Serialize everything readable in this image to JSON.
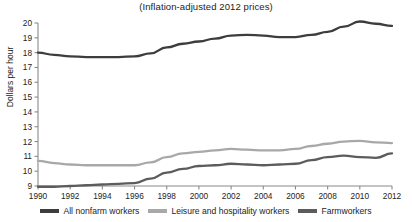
{
  "chart_data": {
    "type": "line",
    "title": "(Inflation-adjusted 2012 prices)",
    "xlabel": "",
    "ylabel": "Dollars per hour",
    "xlim": [
      1990,
      2012
    ],
    "ylim": [
      9,
      20
    ],
    "grid": false,
    "legend_position": "bottom",
    "x": [
      1990,
      1991,
      1992,
      1993,
      1994,
      1995,
      1996,
      1997,
      1998,
      1999,
      2000,
      2001,
      2002,
      2003,
      2004,
      2005,
      2006,
      2007,
      2008,
      2009,
      2010,
      2011,
      2012
    ],
    "xticks": [
      "1990",
      "1992",
      "1994",
      "1996",
      "1998",
      "2000",
      "2002",
      "2004",
      "2006",
      "2008",
      "2010",
      "2012"
    ],
    "yticks": [
      "9",
      "10",
      "11",
      "12",
      "13",
      "14",
      "15",
      "16",
      "17",
      "18",
      "19",
      "20"
    ],
    "series": [
      {
        "name": "All nonfarm workers",
        "color": "#3d3d3d",
        "values": [
          18.0,
          17.85,
          17.75,
          17.7,
          17.7,
          17.7,
          17.75,
          17.95,
          18.35,
          18.6,
          18.75,
          18.95,
          19.15,
          19.2,
          19.15,
          19.05,
          19.05,
          19.2,
          19.4,
          19.75,
          20.1,
          19.95,
          19.8
        ]
      },
      {
        "name": "Leisure and hospitality workers",
        "color": "#a8a8a8",
        "values": [
          10.7,
          10.55,
          10.45,
          10.4,
          10.4,
          10.4,
          10.4,
          10.6,
          10.95,
          11.2,
          11.3,
          11.4,
          11.5,
          11.45,
          11.4,
          11.4,
          11.5,
          11.7,
          11.85,
          12.0,
          12.05,
          11.95,
          11.9
        ]
      },
      {
        "name": "Farmworkers",
        "color": "#5c5c5c",
        "values": [
          8.95,
          8.95,
          9.0,
          9.05,
          9.1,
          9.15,
          9.2,
          9.5,
          9.9,
          10.15,
          10.35,
          10.4,
          10.5,
          10.45,
          10.4,
          10.45,
          10.5,
          10.75,
          10.95,
          11.05,
          10.95,
          10.9,
          11.2
        ]
      }
    ]
  },
  "legend": {
    "items": [
      {
        "label": "All nonfarm workers",
        "color": "#3d3d3d"
      },
      {
        "label": "Leisure and hospitality workers",
        "color": "#a8a8a8"
      },
      {
        "label": "Farmworkers",
        "color": "#5c5c5c"
      }
    ]
  }
}
